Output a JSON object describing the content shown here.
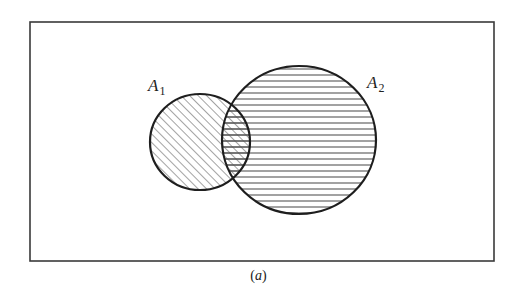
{
  "figure": {
    "caption": {
      "open": "(",
      "letter": "a",
      "close": ")"
    },
    "universe_box": {
      "x": 30,
      "y": 22,
      "width": 464,
      "height": 239,
      "stroke": "#3a3a3a"
    },
    "sets": [
      {
        "name": "A1",
        "label_main": "A",
        "label_sub": "1",
        "label_pos": {
          "x": 148,
          "y": 91
        },
        "center": {
          "x": 200,
          "y": 142
        },
        "rx": 50,
        "ry": 48,
        "hatch": "diagonal",
        "stroke": "#1e1e1e"
      },
      {
        "name": "A2",
        "label_main": "A",
        "label_sub": "2",
        "label_pos": {
          "x": 367,
          "y": 88
        },
        "center": {
          "x": 299,
          "y": 140
        },
        "rx": 77,
        "ry": 74,
        "hatch": "horizontal",
        "stroke": "#1e1e1e"
      }
    ],
    "hatch_color": "#555555",
    "hatch_spacing_px": 6
  }
}
